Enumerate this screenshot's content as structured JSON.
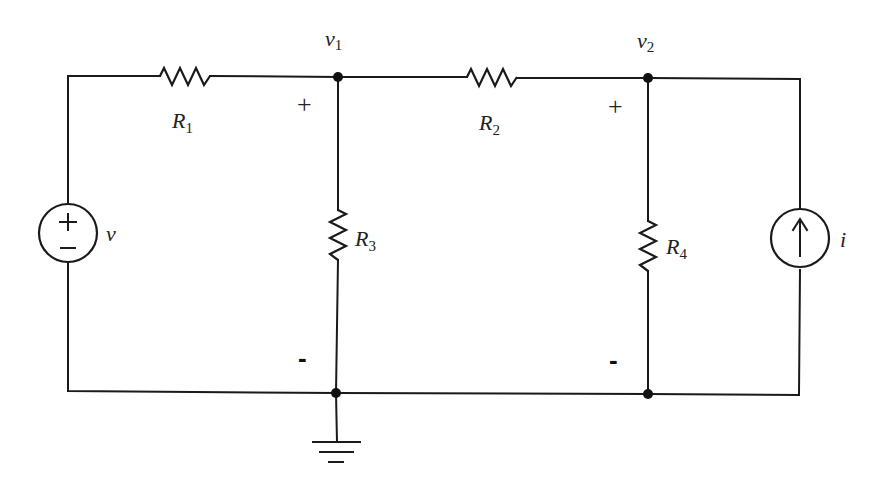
{
  "diagram": {
    "type": "circuit",
    "nodes": {
      "v1": {
        "label": "v",
        "subscript": "1"
      },
      "v2": {
        "label": "v",
        "subscript": "2"
      }
    },
    "components": {
      "R1": {
        "label": "R",
        "subscript": "1",
        "kind": "resistor",
        "connects": [
          "source+",
          "v1"
        ]
      },
      "R2": {
        "label": "R",
        "subscript": "2",
        "kind": "resistor",
        "connects": [
          "v1",
          "v2"
        ]
      },
      "R3": {
        "label": "R",
        "subscript": "3",
        "kind": "resistor",
        "connects": [
          "v1",
          "ground"
        ]
      },
      "R4": {
        "label": "R",
        "subscript": "4",
        "kind": "resistor",
        "connects": [
          "v2",
          "ground"
        ]
      },
      "voltage_source": {
        "label": "v",
        "kind": "voltage-source",
        "plus": "+",
        "minus": "−"
      },
      "current_source": {
        "label": "i",
        "kind": "current-source",
        "direction": "up"
      },
      "ground": {
        "kind": "ground"
      }
    },
    "polarity": {
      "v1_plus": "+",
      "v1_minus": "-",
      "v2_plus": "+",
      "v2_minus": "-"
    }
  }
}
